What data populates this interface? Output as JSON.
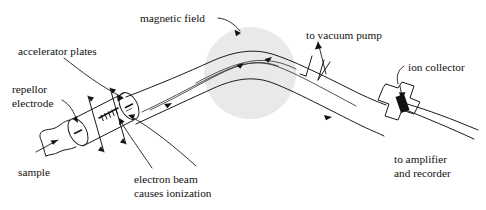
{
  "figure": {
    "background_color": "#ffffff",
    "ink_color": "#1a1a1a",
    "field_color": "#e8e8e8"
  },
  "labels": {
    "magnetic_field": "magnetic field",
    "accelerator_plates": "accelerator plates",
    "repellor_electrode_line1": "repellor",
    "repellor_electrode_line2": "electrode",
    "sample": "sample",
    "electron_beam_line1": "electron beam",
    "electron_beam_line2": "causes ionization",
    "vacuum_pump": "to vacuum pump",
    "ion_collector": "ion collector",
    "amplifier_line1": "to amplifier",
    "amplifier_line2": "and recorder"
  },
  "parts": {
    "magnetic_field_region": "magnetic-field-circle",
    "ion_source_chamber": "ion-source-chamber",
    "repellor_disc": "repellor-electrode-disc",
    "accelerator_disc": "accelerator-plate-disc",
    "sample_inlet": "sample-inlet-neck",
    "electron_beam_axis": "electron-beam-axis",
    "flight_tube": "analyzer-flight-tube",
    "vacuum_port": "vacuum-pump-port",
    "collector_housing": "ion-collector-housing",
    "detector_element": "detector-element",
    "output_leads": "amplifier-output-leads"
  }
}
